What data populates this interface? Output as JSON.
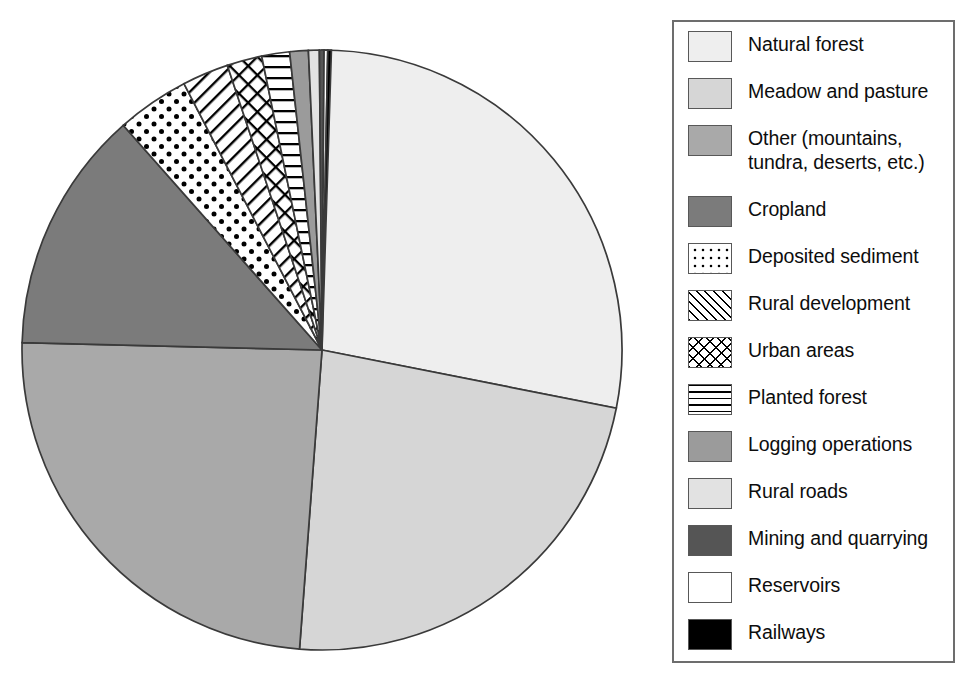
{
  "chart_data": {
    "type": "pie",
    "title": "",
    "subtitle": "",
    "xlabel": "",
    "ylabel": "",
    "legend_position": "right",
    "grid": false,
    "start_angle_deg": 0,
    "direction": "clockwise",
    "units": "percent of total",
    "categories": [
      "Natural forest",
      "Meadow and pasture",
      "Other (mountains,\ntundra, deserts, etc.)",
      "Cropland",
      "Deposited sediment",
      "Rural development",
      "Urban areas",
      "Planted forest",
      "Logging operations",
      "Rural roads",
      "Mining and quarrying",
      "Reservoirs",
      "Railways"
    ],
    "values": [
      28.1,
      23.1,
      24.2,
      13.1,
      3.9,
      2.5,
      1.9,
      1.5,
      1.0,
      0.6,
      0.25,
      0.2,
      0.2
    ],
    "slices": [
      {
        "label": "Natural forest",
        "value": 28.1,
        "start_deg": 0.0,
        "end_deg": 101.2,
        "fill": "#eeeeee",
        "pattern": "solid"
      },
      {
        "label": "Meadow and pasture",
        "value": 23.1,
        "start_deg": 101.2,
        "end_deg": 184.3,
        "fill": "#d6d6d6",
        "pattern": "solid"
      },
      {
        "label": "Other (mountains,\ntundra, deserts, etc.)",
        "value": 24.2,
        "start_deg": 184.3,
        "end_deg": 271.4,
        "fill": "#a9a9a9",
        "pattern": "solid"
      },
      {
        "label": "Cropland",
        "value": 13.1,
        "start_deg": 271.4,
        "end_deg": 318.5,
        "fill": "#7b7b7b",
        "pattern": "solid"
      },
      {
        "label": "Deposited sediment",
        "value": 3.9,
        "start_deg": 318.5,
        "end_deg": 332.6,
        "fill": "#ffffff",
        "pattern": "dots"
      },
      {
        "label": "Rural development",
        "value": 2.5,
        "start_deg": 332.6,
        "end_deg": 341.6,
        "fill": "#ffffff",
        "pattern": "diagonal"
      },
      {
        "label": "Urban areas",
        "value": 1.9,
        "start_deg": 341.6,
        "end_deg": 348.4,
        "fill": "#ffffff",
        "pattern": "crosshatch"
      },
      {
        "label": "Planted forest",
        "value": 1.5,
        "start_deg": 348.4,
        "end_deg": 353.8,
        "fill": "#ffffff",
        "pattern": "horizontal"
      },
      {
        "label": "Logging operations",
        "value": 1.0,
        "start_deg": 353.8,
        "end_deg": 357.4,
        "fill": "#9b9b9b",
        "pattern": "solid"
      },
      {
        "label": "Rural roads",
        "value": 0.6,
        "start_deg": 357.4,
        "end_deg": 359.5,
        "fill": "#e2e2e2",
        "pattern": "solid"
      },
      {
        "label": "Mining and quarrying",
        "value": 0.25,
        "start_deg": 359.5,
        "end_deg": 360.4,
        "fill": "#555555",
        "pattern": "solid"
      },
      {
        "label": "Reservoirs",
        "value": 0.2,
        "start_deg": 360.4,
        "end_deg": 361.1,
        "fill": "#ffffff",
        "pattern": "solid"
      },
      {
        "label": "Railways",
        "value": 0.2,
        "start_deg": 361.1,
        "end_deg": 361.8,
        "fill": "#000000",
        "pattern": "solid"
      }
    ],
    "geometry": {
      "center_x": 322,
      "center_y": 350,
      "radius": 300
    }
  },
  "legend": {
    "items": [
      {
        "label": "Natural forest",
        "swatch": "sw-solid",
        "color": "#eeeeee"
      },
      {
        "label": "Meadow and pasture",
        "swatch": "sw-solid",
        "color": "#d6d6d6"
      },
      {
        "label": "Other (mountains,\ntundra, deserts, etc.)",
        "swatch": "sw-solid",
        "color": "#a9a9a9"
      },
      {
        "label": "Cropland",
        "swatch": "sw-solid",
        "color": "#7b7b7b"
      },
      {
        "label": "Deposited sediment",
        "swatch": "sw-dots",
        "color": "#ffffff"
      },
      {
        "label": "Rural development",
        "swatch": "sw-diag",
        "color": "#ffffff"
      },
      {
        "label": "Urban areas",
        "swatch": "sw-cross",
        "color": "#ffffff"
      },
      {
        "label": "Planted forest",
        "swatch": "sw-horiz",
        "color": "#ffffff"
      },
      {
        "label": "Logging operations",
        "swatch": "sw-solid",
        "color": "#9b9b9b"
      },
      {
        "label": "Rural roads",
        "swatch": "sw-solid",
        "color": "#e2e2e2"
      },
      {
        "label": "Mining and quarrying",
        "swatch": "sw-solid",
        "color": "#555555"
      },
      {
        "label": "Reservoirs",
        "swatch": "sw-solid",
        "color": "#ffffff"
      },
      {
        "label": "Railways",
        "swatch": "sw-solid",
        "color": "#000000"
      }
    ]
  },
  "style": {
    "slice_outline": "#3a3a3a",
    "legend_border": "#6d6d6d",
    "background": "#ffffff",
    "text_color": "#0d0d0d"
  }
}
